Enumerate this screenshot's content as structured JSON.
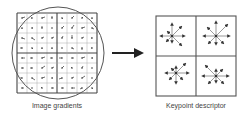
{
  "left_panel": {
    "caption": "Image gradients",
    "grid": {
      "x": 17,
      "y": 13,
      "size": 80,
      "cells": 8
    },
    "circle": {
      "cx": 58,
      "cy": 53,
      "r": 46
    },
    "gradients": [
      [
        0,
        0,
        3,
        -1
      ],
      [
        1,
        0,
        -1,
        0
      ],
      [
        2,
        0,
        3,
        -1
      ],
      [
        3,
        0,
        0,
        -2
      ],
      [
        4,
        0,
        1,
        1
      ],
      [
        5,
        0,
        2,
        -2
      ],
      [
        6,
        0,
        1,
        -1
      ],
      [
        7,
        0,
        0,
        1
      ],
      [
        0,
        1,
        0,
        1
      ],
      [
        1,
        1,
        1,
        0
      ],
      [
        2,
        1,
        0,
        -2
      ],
      [
        3,
        1,
        0,
        0
      ],
      [
        4,
        1,
        2,
        -2
      ],
      [
        5,
        1,
        2,
        -3
      ],
      [
        6,
        1,
        3,
        -1
      ],
      [
        7,
        1,
        2,
        1
      ],
      [
        0,
        2,
        3,
        1
      ],
      [
        1,
        2,
        3,
        2
      ],
      [
        2,
        2,
        2,
        -1
      ],
      [
        3,
        2,
        2,
        -1
      ],
      [
        4,
        2,
        1,
        -2
      ],
      [
        5,
        2,
        0,
        -3
      ],
      [
        6,
        2,
        2,
        -1
      ],
      [
        7,
        2,
        -1,
        0
      ],
      [
        0,
        3,
        -2,
        0
      ],
      [
        1,
        3,
        1,
        1
      ],
      [
        2,
        3,
        0,
        1
      ],
      [
        3,
        3,
        0,
        1
      ],
      [
        4,
        3,
        0,
        0
      ],
      [
        5,
        3,
        2,
        1
      ],
      [
        6,
        3,
        0,
        2
      ],
      [
        7,
        3,
        -1,
        0
      ],
      [
        0,
        4,
        3,
        0
      ],
      [
        1,
        4,
        -2,
        0
      ],
      [
        2,
        4,
        3,
        -1
      ],
      [
        3,
        4,
        -2,
        0
      ],
      [
        4,
        4,
        -3,
        0
      ],
      [
        5,
        4,
        2,
        0
      ],
      [
        6,
        4,
        3,
        -1
      ],
      [
        7,
        4,
        1,
        0
      ],
      [
        0,
        5,
        2,
        0
      ],
      [
        1,
        5,
        -2,
        0
      ],
      [
        2,
        5,
        3,
        -2
      ],
      [
        3,
        5,
        2,
        -1
      ],
      [
        4,
        5,
        2,
        -2
      ],
      [
        5,
        5,
        -1,
        -1
      ],
      [
        6,
        5,
        1,
        -2
      ],
      [
        7,
        5,
        0,
        0
      ],
      [
        0,
        6,
        -2,
        0
      ],
      [
        1,
        6,
        3,
        2
      ],
      [
        2,
        6,
        3,
        -1
      ],
      [
        3,
        6,
        1,
        0
      ],
      [
        4,
        6,
        -3,
        1
      ],
      [
        5,
        6,
        2,
        -1
      ],
      [
        6,
        6,
        3,
        -2
      ],
      [
        7,
        6,
        0,
        0
      ],
      [
        0,
        7,
        2,
        0
      ],
      [
        1,
        7,
        0,
        0
      ],
      [
        2,
        7,
        -1,
        -1
      ],
      [
        3,
        7,
        2,
        0
      ],
      [
        4,
        7,
        2,
        0
      ],
      [
        5,
        7,
        3,
        0
      ],
      [
        6,
        7,
        -2,
        1
      ],
      [
        7,
        7,
        1,
        1
      ]
    ]
  },
  "arrow": {
    "x1": 112,
    "x2": 144,
    "y": 53
  },
  "right_panel": {
    "caption": "Keypoint descriptor",
    "box": {
      "x": 156,
      "y": 16,
      "size": 80
    },
    "histograms": [
      {
        "cx": 196,
        "cy": 36,
        "vectors": [
          [
            0,
            -12
          ],
          [
            9,
            -9
          ],
          [
            12,
            0
          ],
          [
            9,
            9
          ],
          [
            0,
            6
          ],
          [
            -5,
            5
          ],
          [
            -11,
            0
          ],
          [
            -4,
            -4
          ]
        ],
        "center_offset": [
          -4,
          0
        ]
      },
      {
        "cx": 216,
        "cy": 36,
        "vectors": [
          [
            0,
            -14
          ],
          [
            11,
            -11
          ],
          [
            13,
            0
          ],
          [
            7,
            7
          ],
          [
            0,
            8
          ],
          [
            -7,
            7
          ],
          [
            -12,
            0
          ],
          [
            -8,
            -8
          ]
        ],
        "center_offset": [
          0,
          0
        ]
      },
      {
        "cx": 176,
        "cy": 76,
        "vectors": [
          [
            0,
            -6
          ],
          [
            9,
            -9
          ],
          [
            12,
            0
          ],
          [
            6,
            6
          ],
          [
            0,
            10
          ],
          [
            -6,
            6
          ],
          [
            -10,
            0
          ],
          [
            -4,
            -4
          ]
        ],
        "center_offset": [
          0,
          -3
        ]
      },
      {
        "cx": 216,
        "cy": 76,
        "vectors": [
          [
            0,
            -6
          ],
          [
            6,
            -6
          ],
          [
            12,
            0
          ],
          [
            7,
            7
          ],
          [
            0,
            6
          ],
          [
            -7,
            7
          ],
          [
            -13,
            0
          ],
          [
            -10,
            -10
          ]
        ],
        "center_offset": [
          0,
          0
        ]
      }
    ]
  },
  "colors": {
    "line": "#444444",
    "grid": "#999999",
    "arrow": "#222222"
  }
}
